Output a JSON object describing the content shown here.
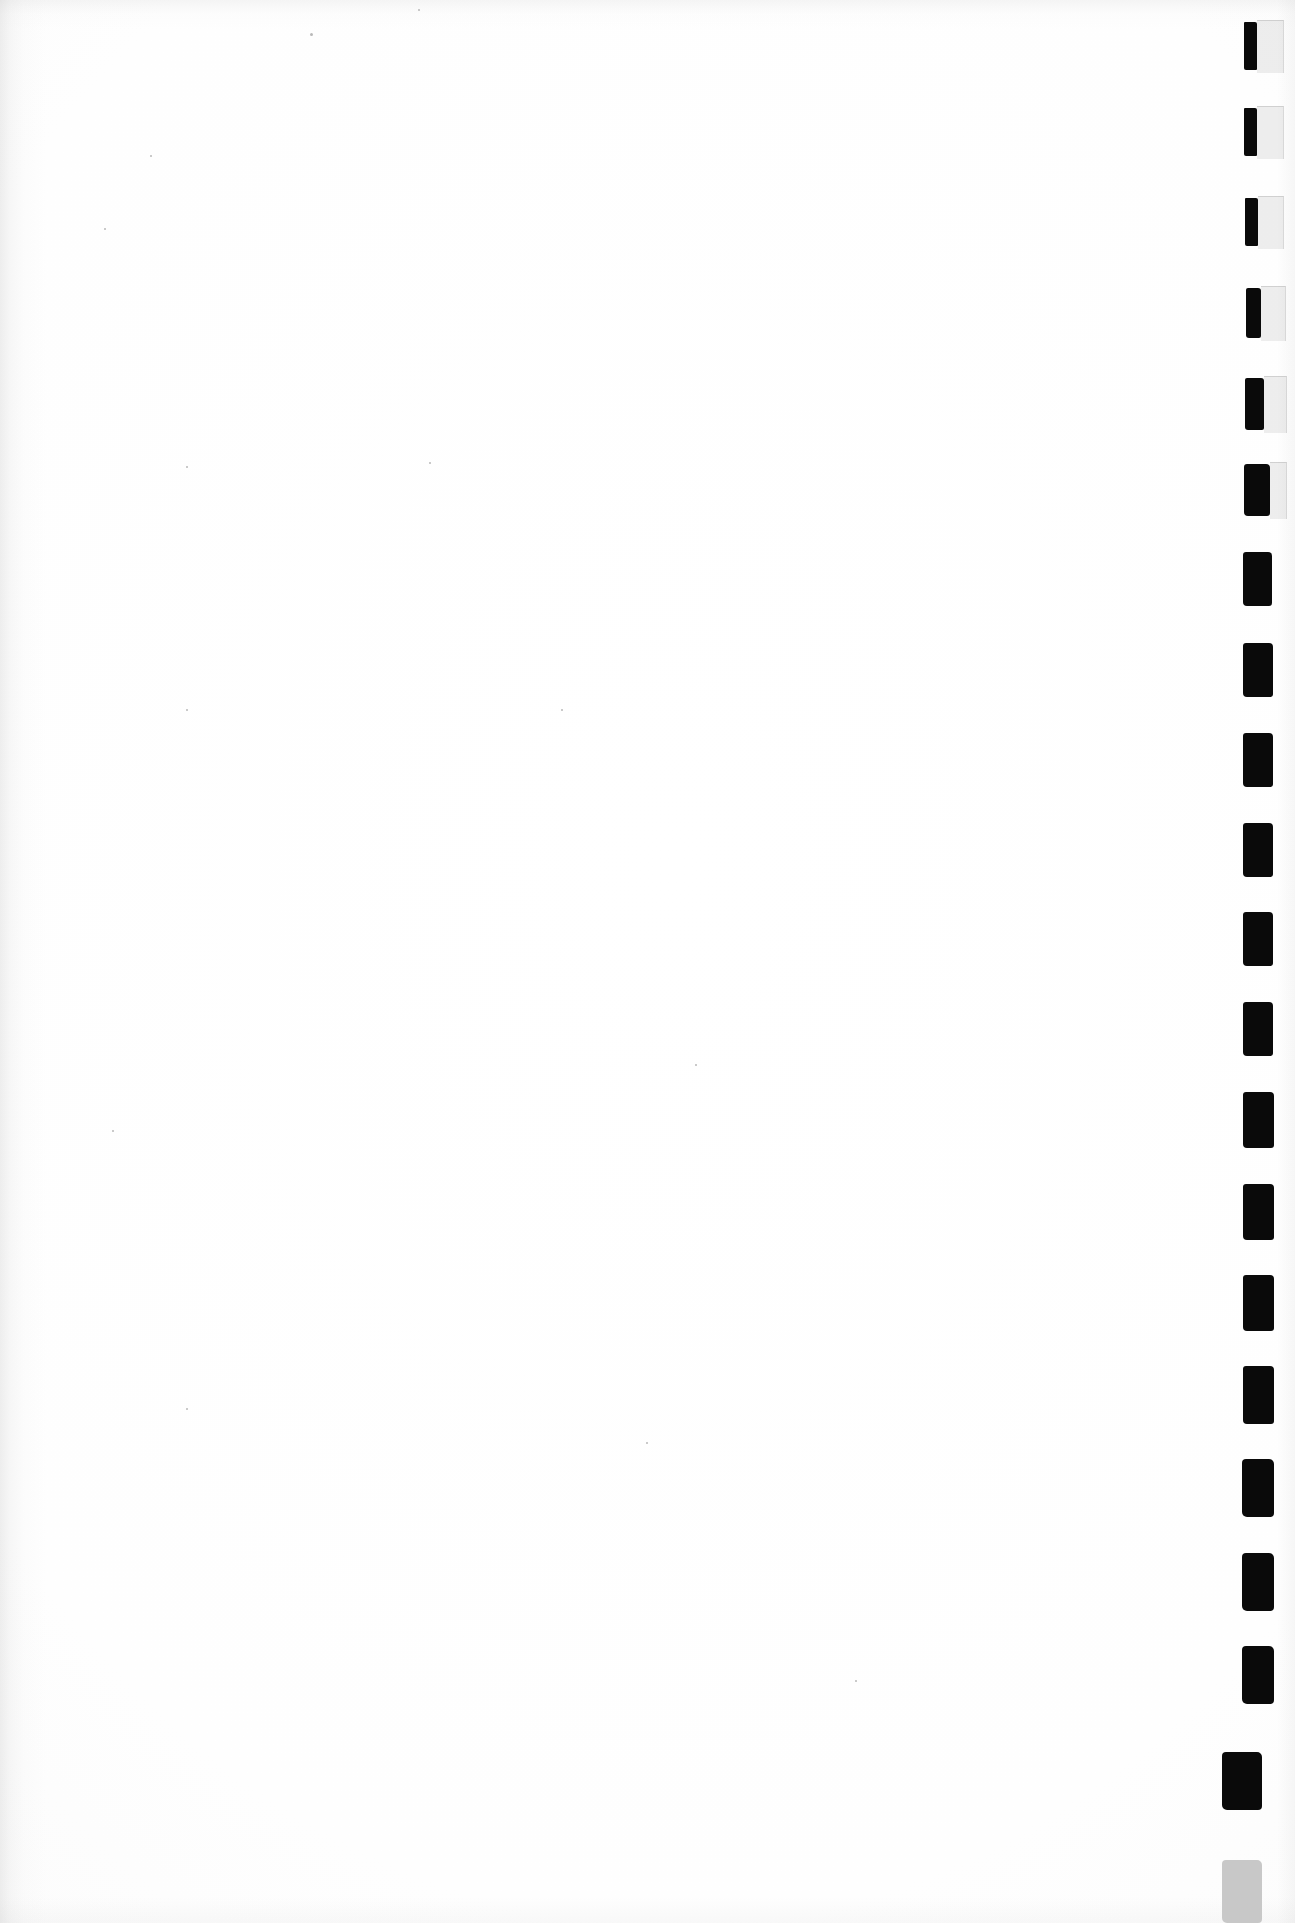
{
  "document": {
    "kind": "scanned-page",
    "page_label": "",
    "body_text": "",
    "description_visible_text": "",
    "background_color": "#fefefe",
    "ink_color": "#0a0a0a",
    "faded_ink_color": "#c8c8c8",
    "ghost_tint_color": "#78787822",
    "page_width": 1295,
    "page_height": 1923
  },
  "thumb_index": {
    "label": "",
    "count": 18,
    "alignment": "right-edge",
    "pitch": 95,
    "marks": [
      {
        "index": 1,
        "x": 1244,
        "y": 22,
        "width": 13,
        "height": 48,
        "color": "#0a0a0a",
        "ghost": {
          "x": 1257,
          "y": 20,
          "width": 26,
          "height": 52
        }
      },
      {
        "index": 2,
        "x": 1244,
        "y": 108,
        "width": 13,
        "height": 48,
        "color": "#0a0a0a",
        "ghost": {
          "x": 1257,
          "y": 106,
          "width": 26,
          "height": 52
        }
      },
      {
        "index": 3,
        "x": 1245,
        "y": 198,
        "width": 13,
        "height": 48,
        "color": "#0a0a0a",
        "ghost": {
          "x": 1258,
          "y": 196,
          "width": 25,
          "height": 52
        }
      },
      {
        "index": 4,
        "x": 1246,
        "y": 288,
        "width": 15,
        "height": 50,
        "color": "#0a0a0a",
        "ghost": {
          "x": 1261,
          "y": 286,
          "width": 24,
          "height": 54
        }
      },
      {
        "index": 5,
        "x": 1245,
        "y": 378,
        "width": 19,
        "height": 52,
        "color": "#0a0a0a",
        "ghost": {
          "x": 1264,
          "y": 376,
          "width": 22,
          "height": 56
        }
      },
      {
        "index": 6,
        "x": 1244,
        "y": 464,
        "width": 26,
        "height": 52,
        "color": "#0a0a0a",
        "ghost": {
          "x": 1270,
          "y": 462,
          "width": 16,
          "height": 56
        }
      },
      {
        "index": 7,
        "x": 1243,
        "y": 552,
        "width": 29,
        "height": 54,
        "color": "#0a0a0a",
        "ghost": null
      },
      {
        "index": 8,
        "x": 1243,
        "y": 643,
        "width": 30,
        "height": 54,
        "color": "#0a0a0a",
        "ghost": null
      },
      {
        "index": 9,
        "x": 1243,
        "y": 733,
        "width": 30,
        "height": 54,
        "color": "#0a0a0a",
        "ghost": null
      },
      {
        "index": 10,
        "x": 1243,
        "y": 823,
        "width": 30,
        "height": 54,
        "color": "#0a0a0a",
        "ghost": null
      },
      {
        "index": 11,
        "x": 1243,
        "y": 912,
        "width": 30,
        "height": 54,
        "color": "#0a0a0a",
        "ghost": null
      },
      {
        "index": 12,
        "x": 1243,
        "y": 1002,
        "width": 30,
        "height": 54,
        "color": "#0a0a0a",
        "ghost": null
      },
      {
        "index": 13,
        "x": 1243,
        "y": 1092,
        "width": 31,
        "height": 56,
        "color": "#0a0a0a",
        "ghost": null
      },
      {
        "index": 14,
        "x": 1243,
        "y": 1184,
        "width": 31,
        "height": 56,
        "color": "#0a0a0a",
        "ghost": null
      },
      {
        "index": 15,
        "x": 1243,
        "y": 1275,
        "width": 31,
        "height": 56,
        "color": "#0a0a0a",
        "ghost": null
      },
      {
        "index": 16,
        "x": 1243,
        "y": 1366,
        "width": 31,
        "height": 58,
        "color": "#0a0a0a",
        "ghost": null
      },
      {
        "index": 17,
        "x": 1242,
        "y": 1459,
        "width": 32,
        "height": 58,
        "color": "#0a0a0a",
        "ghost": null
      },
      {
        "index": 18,
        "x": 1242,
        "y": 1553,
        "width": 32,
        "height": 58,
        "color": "#0a0a0a",
        "ghost": null
      },
      {
        "index": 19,
        "x": 1242,
        "y": 1646,
        "width": 32,
        "height": 58,
        "color": "#0a0a0a",
        "ghost": null
      },
      {
        "index": 20,
        "x": 1222,
        "y": 1752,
        "width": 40,
        "height": 58,
        "color": "#0a0a0a",
        "ghost": null
      },
      {
        "index": 21,
        "x": 1222,
        "y": 1860,
        "width": 40,
        "height": 63,
        "color": "#c8c8c8",
        "ghost": null
      }
    ]
  },
  "artifacts": {
    "specks": [
      {
        "x": 310,
        "y": 33,
        "size": 3
      },
      {
        "x": 104,
        "y": 228,
        "size": 2
      },
      {
        "x": 150,
        "y": 155,
        "size": 2
      },
      {
        "x": 418,
        "y": 9,
        "size": 2
      },
      {
        "x": 186,
        "y": 709,
        "size": 2
      },
      {
        "x": 561,
        "y": 709,
        "size": 2
      },
      {
        "x": 429,
        "y": 462,
        "size": 2
      },
      {
        "x": 186,
        "y": 466,
        "size": 2
      },
      {
        "x": 695,
        "y": 1064,
        "size": 2
      },
      {
        "x": 646,
        "y": 1442,
        "size": 2
      },
      {
        "x": 186,
        "y": 1408,
        "size": 2
      },
      {
        "x": 112,
        "y": 1130,
        "size": 2
      },
      {
        "x": 855,
        "y": 1680,
        "size": 2
      }
    ]
  }
}
